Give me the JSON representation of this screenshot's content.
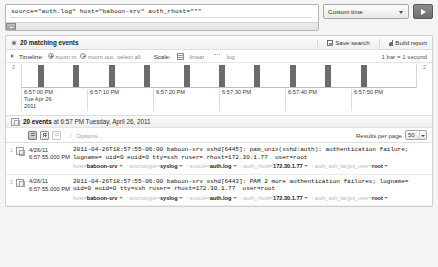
{
  "search": {
    "query": "source=\"auth.log\" host=\"baboon-srv\" auth_rhost=\"*\"",
    "time_range_label": "Custom time",
    "go_button_label": "Go",
    "scrollbar_name": "search-horizontal-scrollbar"
  },
  "results_header": {
    "matching_events": "20 matching events",
    "save_search": "Save search",
    "build_report": "Build report"
  },
  "timeline_toolbar": {
    "timeline_label": "Timeline:",
    "zoom_in": "zoom in",
    "zoom_out": "zoom out",
    "select_all": "select all",
    "scale_label": "Scale:",
    "linear": "linear",
    "log": "log",
    "bar_scale": "1 bar = 1 second"
  },
  "chart_data": {
    "type": "bar",
    "title": "",
    "xlabel": "",
    "ylabel": "",
    "ylim": [
      0,
      2
    ],
    "y_axis_left_label": "2",
    "y_axis_right_label": "2",
    "grid": false,
    "legend": "none",
    "bar_unit": "1 bar = 1 second",
    "x_tick_labels": [
      "6:57:00 PM",
      "6:57:10 PM",
      "6:57:20 PM",
      "6:57:30 PM",
      "6:57:40 PM",
      "6:57:50 PM"
    ],
    "x_tick_sublabel": "Tue Apr 26\n2011",
    "categories": [
      "6:57:00 PM",
      "6:57:05 PM",
      "6:57:10 PM",
      "6:57:15 PM",
      "6:57:20 PM",
      "6:57:25 PM",
      "6:57:30 PM",
      "6:57:35 PM",
      "6:57:40 PM",
      "6:57:45 PM",
      "6:57:50 PM",
      "6:57:55 PM"
    ],
    "values": [
      2,
      2,
      2,
      2,
      2,
      2,
      2,
      2,
      2,
      2,
      2,
      2
    ],
    "bar_positions_pct": [
      4,
      13,
      22,
      31,
      41,
      50,
      59,
      68,
      77,
      86
    ],
    "bar_color": "#6b6b6b"
  },
  "events_header": {
    "summary_count": "20 events",
    "summary_at": " at 6:57 PM Tuesday, April 26, 2011",
    "options_label": "Options...",
    "results_per_page_label": "Results per page",
    "results_per_page_value": "50"
  },
  "events": [
    {
      "index": "1",
      "date": "4/26/11",
      "time": "6:57:55.000 PM",
      "text": "2011-04-26T18:57:55-06:00 baboon-srv sshd[6445]: pam_unix(sshd:auth): authentication failure; logname= uid=0 euid=0 tty=ssh ruser= rhost=172.30.1.77  user=root",
      "fields": [
        {
          "key": "host=",
          "value": "baboon-srv"
        },
        {
          "key": "sourcetype=",
          "value": "syslog"
        },
        {
          "key": "source=",
          "value": "auth.log"
        },
        {
          "key": "auth_rhost=",
          "value": "172.30.1.77"
        },
        {
          "key": "auth_ssh_target_user=",
          "value": "root"
        }
      ]
    },
    {
      "index": "2",
      "date": "4/26/11",
      "time": "6:57:55.000 PM",
      "text": "2011-04-26T18:57:55-06:00 baboon-srv sshd[6443]: PAM 2 more authentication failures; logname= uid=0 euid=0 tty=ssh ruser= rhost=172.30.1.77  user=root",
      "fields": [
        {
          "key": "host=",
          "value": "baboon-srv"
        },
        {
          "key": "sourcetype=",
          "value": "syslog"
        },
        {
          "key": "source=",
          "value": "auth.log"
        },
        {
          "key": "auth_rhost=",
          "value": "172.30.1.77"
        },
        {
          "key": "auth_ssh_target_user=",
          "value": "root"
        }
      ]
    }
  ],
  "colors": {
    "bar": "#6b6b6b",
    "panel_bg": "#ffffff",
    "app_bg": "#f4f4f4",
    "field_value": "#1a1a1a"
  }
}
